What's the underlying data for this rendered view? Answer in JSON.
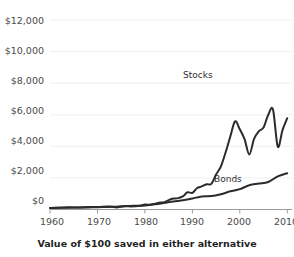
{
  "chart_data": {
    "type": "line",
    "title": "",
    "xlabel": "Value of $100 saved in either alternative",
    "ylabel": "",
    "xlim": [
      1960,
      2011
    ],
    "ylim": [
      0,
      12000
    ],
    "grid": true,
    "legend_position": "inline-annotation",
    "yticks": [
      "$0",
      "$2,000",
      "$4,000",
      "$6,000",
      "$8,000",
      "$10,000",
      "$12,000"
    ],
    "ytick_values": [
      0,
      2000,
      4000,
      6000,
      8000,
      10000,
      12000
    ],
    "xticks": [
      "1960",
      "1970",
      "1980",
      "1990",
      "2000",
      "2010"
    ],
    "xtick_values": [
      1960,
      1970,
      1980,
      1990,
      2000,
      2010
    ],
    "line_color": "#2b2b2b",
    "grid_color": "#efefef",
    "axis_color": "#9a9a9a",
    "series": [
      {
        "name": "Stocks",
        "label_x": 1993,
        "label_y": 8300,
        "x": [
          1960,
          1962,
          1964,
          1966,
          1968,
          1970,
          1972,
          1973,
          1974,
          1975,
          1976,
          1977,
          1978,
          1979,
          1980,
          1981,
          1982,
          1983,
          1984,
          1985,
          1986,
          1987,
          1988,
          1989,
          1990,
          1991,
          1992,
          1993,
          1994,
          1995,
          1996,
          1997,
          1998,
          1999,
          2000,
          2001,
          2002,
          2003,
          2004,
          2005,
          2006,
          2007,
          2008,
          2009,
          2010
        ],
        "values": [
          100,
          110,
          135,
          130,
          160,
          155,
          190,
          175,
          130,
          170,
          205,
          195,
          205,
          240,
          310,
          300,
          355,
          430,
          450,
          590,
          690,
          720,
          830,
          1090,
          1050,
          1360,
          1460,
          1600,
          1620,
          2220,
          2720,
          3610,
          4620,
          5580,
          5080,
          4460,
          3480,
          4470,
          4950,
          5190,
          6000,
          6320,
          3980,
          5030,
          5780
        ]
      },
      {
        "name": "Bonds",
        "label_x": 1994,
        "label_y": 2050,
        "x": [
          1960,
          1962,
          1964,
          1966,
          1968,
          1970,
          1972,
          1974,
          1976,
          1978,
          1980,
          1982,
          1984,
          1986,
          1988,
          1990,
          1992,
          1994,
          1996,
          1998,
          2000,
          2002,
          2004,
          2006,
          2008,
          2010
        ],
        "values": [
          100,
          108,
          116,
          122,
          130,
          145,
          165,
          180,
          215,
          235,
          250,
          330,
          410,
          510,
          580,
          690,
          830,
          850,
          970,
          1150,
          1290,
          1540,
          1640,
          1740,
          2100,
          2300
        ]
      }
    ],
    "annotations": [
      {
        "text": "Stocks",
        "x_px": 183,
        "y_px": 70
      },
      {
        "text": "Bonds",
        "x_px": 214,
        "y_px": 174
      }
    ]
  },
  "axis": {
    "y_labels": [
      {
        "text": "$12,000",
        "top": 15
      },
      {
        "text": "$10,000",
        "top": 45
      },
      {
        "text": "$8,000",
        "top": 75
      },
      {
        "text": "$6,000",
        "top": 105
      },
      {
        "text": "$4,000",
        "top": 135
      },
      {
        "text": "$2,000",
        "top": 165
      },
      {
        "text": "$0",
        "top": 195
      }
    ],
    "x_labels": [
      {
        "text": "1960",
        "left": 52
      },
      {
        "text": "1970",
        "left": 99
      },
      {
        "text": "1980",
        "left": 146
      },
      {
        "text": "1990",
        "left": 192
      },
      {
        "text": "2000",
        "left": 239
      },
      {
        "text": "2010",
        "left": 286
      }
    ],
    "x_title": "Value of $100 saved in either alternative"
  }
}
